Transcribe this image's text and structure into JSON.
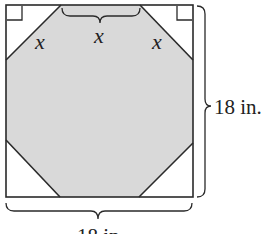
{
  "figure": {
    "colors": {
      "octagon_fill": "#d9d9d9",
      "stroke": "#2a2a2a",
      "background": "#ffffff"
    },
    "labels": {
      "top_left_side": "x",
      "top_side": "x",
      "top_right_side": "x",
      "right_dimension": "18 in.",
      "bottom_dimension": "18 in."
    },
    "right_angle_markers": [
      "top-left corner",
      "top-right corner"
    ]
  }
}
